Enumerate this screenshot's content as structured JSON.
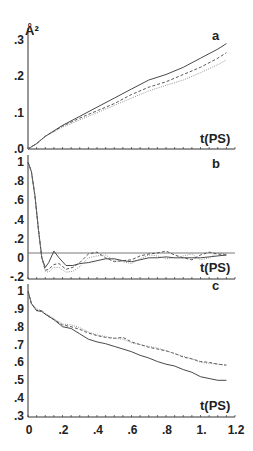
{
  "chart_data": [
    {
      "panel": "a",
      "type": "line",
      "title": "a",
      "xlabel": "t(PS)",
      "ylabel": "Å²",
      "xlim": [
        0,
        1.2
      ],
      "ylim": [
        0,
        0.3
      ],
      "yticks": [
        ".0",
        ".1",
        ".2",
        ".3"
      ],
      "x": [
        0,
        0.05,
        0.1,
        0.2,
        0.3,
        0.4,
        0.5,
        0.6,
        0.7,
        0.8,
        0.9,
        1.0,
        1.1,
        1.15
      ],
      "series": [
        {
          "name": "solid",
          "style": "solid",
          "values": [
            0,
            0.015,
            0.035,
            0.065,
            0.09,
            0.115,
            0.14,
            0.165,
            0.19,
            0.205,
            0.225,
            0.25,
            0.275,
            0.29
          ]
        },
        {
          "name": "dashed",
          "style": "dashed",
          "values": [
            0,
            0.015,
            0.035,
            0.063,
            0.085,
            0.105,
            0.125,
            0.15,
            0.17,
            0.185,
            0.205,
            0.225,
            0.25,
            0.265
          ]
        },
        {
          "name": "dotted",
          "style": "dotted",
          "values": [
            0,
            0.015,
            0.035,
            0.06,
            0.08,
            0.1,
            0.12,
            0.14,
            0.16,
            0.175,
            0.19,
            0.21,
            0.232,
            0.245
          ]
        }
      ]
    },
    {
      "panel": "b",
      "type": "line",
      "title": "b",
      "xlabel": "t(PS)",
      "ylabel": "",
      "xlim": [
        0,
        1.2
      ],
      "ylim": [
        -0.2,
        1.0
      ],
      "yticks": [
        "-.2",
        "0",
        ".2",
        ".4",
        ".6",
        ".8",
        "1"
      ],
      "x": [
        0,
        0.02,
        0.04,
        0.06,
        0.08,
        0.1,
        0.12,
        0.15,
        0.18,
        0.22,
        0.26,
        0.3,
        0.35,
        0.4,
        0.45,
        0.5,
        0.55,
        0.6,
        0.65,
        0.7,
        0.75,
        0.8,
        0.85,
        0.9,
        0.95,
        1.0,
        1.05,
        1.1,
        1.15
      ],
      "series": [
        {
          "name": "solid",
          "style": "solid",
          "values": [
            1.0,
            0.9,
            0.65,
            0.3,
            0.0,
            -0.1,
            -0.05,
            0.07,
            0.0,
            -0.08,
            -0.08,
            -0.06,
            -0.05,
            -0.03,
            -0.01,
            -0.01,
            -0.03,
            -0.04,
            -0.02,
            0.0,
            0.0,
            0.01,
            0.0,
            0.0,
            0.0,
            0.0,
            0.01,
            0.02,
            0.03
          ]
        },
        {
          "name": "dashed",
          "style": "dashed",
          "values": [
            1.0,
            0.9,
            0.65,
            0.3,
            0.0,
            -0.13,
            -0.12,
            -0.07,
            -0.06,
            -0.12,
            -0.1,
            -0.05,
            0.04,
            0.06,
            0.0,
            -0.04,
            -0.03,
            -0.02,
            0.02,
            0.04,
            0.05,
            0.07,
            0.03,
            0.0,
            -0.02,
            0.03,
            0.06,
            0.04,
            0.03
          ]
        },
        {
          "name": "dotted",
          "style": "dotted",
          "values": [
            1.0,
            0.9,
            0.65,
            0.3,
            0.0,
            -0.14,
            -0.15,
            -0.1,
            -0.1,
            -0.15,
            -0.14,
            -0.09,
            0.0,
            0.02,
            0.03,
            -0.03,
            -0.04,
            -0.06,
            -0.01,
            0.03,
            0.02,
            -0.01,
            0.0,
            0.02,
            0.04,
            -0.02,
            0.0,
            0.05,
            0.04
          ]
        }
      ]
    },
    {
      "panel": "c",
      "type": "line",
      "title": "c",
      "xlabel": "t(PS)",
      "ylabel": "",
      "xlim": [
        0,
        1.2
      ],
      "ylim": [
        0.3,
        1.0
      ],
      "yticks": [
        ".3",
        ".4",
        ".5",
        ".6",
        ".7",
        ".8",
        ".9",
        "1"
      ],
      "xticks": [
        "0",
        ".2",
        ".4",
        ".6",
        ".8",
        "1.",
        "1.2"
      ],
      "x": [
        0,
        0.02,
        0.05,
        0.08,
        0.1,
        0.15,
        0.2,
        0.25,
        0.3,
        0.35,
        0.4,
        0.45,
        0.5,
        0.55,
        0.6,
        0.65,
        0.7,
        0.75,
        0.8,
        0.85,
        0.9,
        0.95,
        1.0,
        1.05,
        1.1,
        1.15
      ],
      "series": [
        {
          "name": "solid",
          "style": "solid",
          "values": [
            1.0,
            0.93,
            0.89,
            0.885,
            0.87,
            0.84,
            0.8,
            0.79,
            0.76,
            0.73,
            0.715,
            0.705,
            0.69,
            0.675,
            0.66,
            0.64,
            0.625,
            0.605,
            0.59,
            0.58,
            0.56,
            0.545,
            0.52,
            0.51,
            0.5,
            0.5
          ]
        },
        {
          "name": "dashed",
          "style": "dashed",
          "values": [
            1.0,
            0.93,
            0.89,
            0.89,
            0.87,
            0.84,
            0.81,
            0.8,
            0.785,
            0.765,
            0.75,
            0.74,
            0.735,
            0.74,
            0.715,
            0.7,
            0.685,
            0.675,
            0.665,
            0.65,
            0.63,
            0.62,
            0.605,
            0.6,
            0.59,
            0.585
          ]
        },
        {
          "name": "dotted",
          "style": "dotted",
          "values": [
            1.0,
            0.93,
            0.9,
            0.89,
            0.875,
            0.845,
            0.815,
            0.81,
            0.795,
            0.77,
            0.755,
            0.745,
            0.735,
            0.73,
            0.71,
            0.7,
            0.69,
            0.68,
            0.665,
            0.65,
            0.635,
            0.62,
            0.6,
            0.595,
            0.59,
            0.585
          ]
        }
      ]
    }
  ],
  "panels": {
    "a": {
      "label": "a",
      "xlabel": "t(PS)",
      "ylabel": "Å²"
    },
    "b": {
      "label": "b",
      "xlabel": "t(PS)"
    },
    "c": {
      "label": "c",
      "xlabel": "t(PS)"
    }
  }
}
